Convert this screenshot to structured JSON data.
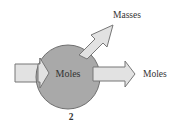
{
  "diagram": {
    "center_label": "Moles",
    "output_right_label": "Moles",
    "output_diag_label": "Masses",
    "step_number": "2",
    "colors": {
      "circle_fill": "#a9a9a9",
      "circle_stroke": "#6f6f6f",
      "arrow_fill": "#e2e2e2",
      "arrow_stroke": "#777777",
      "text": "#333333"
    }
  }
}
